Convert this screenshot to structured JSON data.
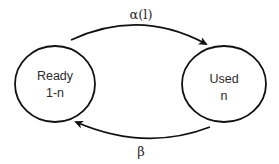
{
  "diagram": {
    "type": "state-transition",
    "colors": {
      "background": "#ffffff",
      "stroke": "#111111",
      "text": "#2a2a2a"
    },
    "nodes": [
      {
        "id": "ready",
        "label_line1": "Ready",
        "label_line2": "1-n"
      },
      {
        "id": "used",
        "label_line1": "Used",
        "label_line2": "n"
      }
    ],
    "edges": [
      {
        "from": "ready",
        "to": "used",
        "label": "α(l)"
      },
      {
        "from": "used",
        "to": "ready",
        "label": "β"
      }
    ]
  }
}
